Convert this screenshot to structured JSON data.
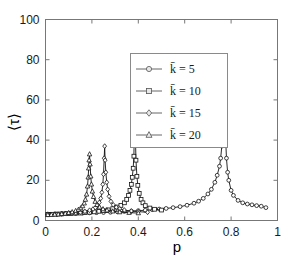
{
  "chart_data": {
    "type": "line",
    "title": "",
    "xlabel": "p",
    "ylabel": "⟨τ⟩",
    "xlim": [
      0,
      1
    ],
    "ylim": [
      0,
      100
    ],
    "xticks": [
      "0",
      "0.2",
      "0.4",
      "0.6",
      "0.8",
      "1"
    ],
    "xtick_values": [
      0,
      0.2,
      0.4,
      0.6,
      0.8,
      1
    ],
    "yticks": [
      "0",
      "20",
      "40",
      "60",
      "80",
      "100"
    ],
    "ytick_values": [
      0,
      20,
      40,
      60,
      80,
      100
    ],
    "grid": false,
    "legend_position": "upper center",
    "series": [
      {
        "name": "k̄ = 5",
        "marker": "circle",
        "peak_x": 0.77,
        "peak_y": 81,
        "x": [
          0.01,
          0.04,
          0.07,
          0.1,
          0.13,
          0.16,
          0.19,
          0.22,
          0.25,
          0.28,
          0.31,
          0.34,
          0.37,
          0.4,
          0.43,
          0.46,
          0.49,
          0.52,
          0.55,
          0.58,
          0.61,
          0.64,
          0.66,
          0.68,
          0.7,
          0.715,
          0.73,
          0.74,
          0.75,
          0.755,
          0.76,
          0.765,
          0.768,
          0.77,
          0.773,
          0.776,
          0.78,
          0.785,
          0.79,
          0.8,
          0.81,
          0.83,
          0.85,
          0.87,
          0.89,
          0.91,
          0.93,
          0.95
        ],
        "y": [
          3.2,
          3.3,
          3.4,
          3.5,
          3.6,
          3.7,
          3.8,
          3.9,
          4.0,
          4.1,
          4.3,
          4.5,
          4.7,
          4.9,
          5.1,
          5.4,
          5.7,
          6.0,
          6.4,
          6.9,
          7.6,
          8.6,
          9.6,
          11.0,
          13.2,
          15.5,
          19.0,
          22.5,
          27.0,
          31.0,
          37.0,
          43.0,
          55.0,
          81.0,
          56.0,
          42.0,
          31.0,
          24.0,
          20.0,
          15.0,
          12.5,
          10.0,
          8.8,
          8.2,
          7.8,
          7.4,
          7.1,
          6.4
        ]
      },
      {
        "name": "k̄ = 10",
        "marker": "square",
        "peak_x": 0.385,
        "peak_y": 81,
        "x": [
          0.01,
          0.03,
          0.05,
          0.07,
          0.09,
          0.11,
          0.13,
          0.15,
          0.17,
          0.19,
          0.21,
          0.23,
          0.25,
          0.27,
          0.29,
          0.31,
          0.325,
          0.34,
          0.35,
          0.358,
          0.364,
          0.37,
          0.374,
          0.378,
          0.381,
          0.383,
          0.385,
          0.387,
          0.39,
          0.394,
          0.398,
          0.404,
          0.412,
          0.42,
          0.43,
          0.45,
          0.47,
          0.5
        ],
        "y": [
          3.0,
          3.1,
          3.2,
          3.3,
          3.4,
          3.5,
          3.6,
          3.7,
          3.9,
          4.1,
          4.3,
          4.6,
          4.9,
          5.3,
          5.9,
          6.7,
          7.5,
          8.8,
          10.5,
          12.5,
          15.0,
          18.0,
          21.5,
          26.0,
          32.0,
          46.0,
          81.0,
          44.0,
          30.0,
          22.0,
          17.5,
          13.5,
          10.5,
          8.8,
          7.4,
          6.2,
          5.6,
          5.2
        ]
      },
      {
        "name": "k̄ = 15",
        "marker": "diamond",
        "peak_x": 0.255,
        "peak_y": 37,
        "x": [
          0.01,
          0.03,
          0.05,
          0.07,
          0.09,
          0.11,
          0.13,
          0.15,
          0.17,
          0.19,
          0.205,
          0.215,
          0.225,
          0.232,
          0.238,
          0.243,
          0.247,
          0.25,
          0.253,
          0.255,
          0.257,
          0.26,
          0.264,
          0.268,
          0.274,
          0.282,
          0.292,
          0.305,
          0.32,
          0.34,
          0.37,
          0.4,
          0.44
        ],
        "y": [
          2.9,
          3.0,
          3.1,
          3.2,
          3.4,
          3.6,
          3.8,
          4.1,
          4.5,
          5.1,
          5.7,
          6.4,
          7.6,
          9.0,
          11.0,
          14.0,
          18.0,
          23.0,
          31.0,
          37.0,
          30.0,
          24.0,
          19.0,
          15.5,
          12.0,
          9.5,
          7.8,
          6.6,
          5.8,
          5.2,
          4.7,
          4.4,
          4.1
        ]
      },
      {
        "name": "k̄ = 20",
        "marker": "triangle",
        "peak_x": 0.19,
        "peak_y": 33,
        "x": [
          0.01,
          0.025,
          0.04,
          0.055,
          0.07,
          0.085,
          0.1,
          0.115,
          0.13,
          0.142,
          0.152,
          0.16,
          0.167,
          0.172,
          0.177,
          0.181,
          0.184,
          0.186,
          0.188,
          0.19,
          0.192,
          0.195,
          0.198,
          0.202,
          0.207,
          0.214,
          0.222,
          0.233,
          0.248,
          0.265,
          0.29,
          0.32,
          0.36,
          0.4
        ],
        "y": [
          2.8,
          2.9,
          3.0,
          3.1,
          3.3,
          3.5,
          3.8,
          4.2,
          4.8,
          5.4,
          6.2,
          7.2,
          8.6,
          10.4,
          13.0,
          17.0,
          21.5,
          26.0,
          30.0,
          33.0,
          28.0,
          22.0,
          18.0,
          14.5,
          11.8,
          9.4,
          7.8,
          6.6,
          5.7,
          5.1,
          4.6,
          4.2,
          3.9,
          3.7
        ]
      }
    ]
  },
  "legend": {
    "entries": [
      {
        "label": "k̄ = 5",
        "marker": "circle-marker"
      },
      {
        "label": "k̄ = 10",
        "marker": "square-marker"
      },
      {
        "label": "k̄ = 15",
        "marker": "diamond-marker"
      },
      {
        "label": "k̄ = 20",
        "marker": "triangle-marker"
      }
    ]
  },
  "colors": {
    "data": "#111111",
    "axis": "#777777",
    "legend_border": "#8a8a8a",
    "background": "#ffffff"
  }
}
